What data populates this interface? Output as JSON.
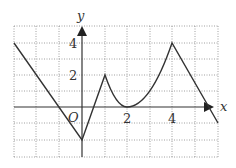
{
  "figure": {
    "type": "function-graph",
    "axes": {
      "x_label": "x",
      "y_label": "y",
      "origin_label": "O",
      "x_tick_labels": [
        "2",
        "4"
      ],
      "y_tick_labels": [
        "2",
        "4"
      ]
    },
    "grid": {
      "x_range": [
        -3,
        6
      ],
      "y_range": [
        -3,
        5
      ],
      "style": "dotted"
    },
    "curve_points": [
      {
        "x": -3,
        "y": 4
      },
      {
        "x": 0,
        "y": -2
      },
      {
        "x": 1,
        "y": 2
      },
      {
        "x": 2,
        "y": 0,
        "note": "parabolic arc from (1,2) to (4,4) with vertex at (2,0)"
      },
      {
        "x": 4,
        "y": 4
      },
      {
        "x": 5.5,
        "y": -1
      }
    ],
    "colors": {
      "curve": "#333333",
      "axis": "#333333",
      "grid": "#888888"
    }
  }
}
